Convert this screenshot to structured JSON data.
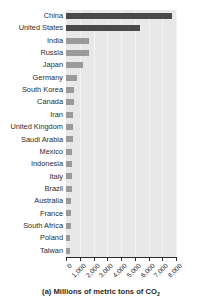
{
  "chart_data": {
    "type": "bar",
    "orientation": "horizontal",
    "title": "",
    "caption": "(a) Millions of metric tons of CO",
    "caption_subscript": "2",
    "xlabel": "Millions of metric tons of CO2",
    "ylabel": "",
    "xlim": [
      0,
      8000
    ],
    "ylim": null,
    "grid": true,
    "grid_axis": "x",
    "legend": false,
    "categories": [
      "China",
      "United States",
      "India",
      "Russia",
      "Japan",
      "Germany",
      "South Korea",
      "Canada",
      "Iran",
      "United Kingdom",
      "Saudi Arabia",
      "Mexico",
      "Indonesia",
      "Italy",
      "Brazil",
      "Australia",
      "France",
      "South Africa",
      "Poland",
      "Taiwan"
    ],
    "values": [
      7700,
      5400,
      1700,
      1700,
      1250,
      800,
      600,
      560,
      540,
      510,
      480,
      460,
      440,
      420,
      400,
      390,
      370,
      350,
      320,
      280
    ],
    "xticks": [
      0,
      1000,
      2000,
      3000,
      4000,
      5000,
      6000,
      7000,
      8000
    ],
    "xticklabels": [
      "0",
      "1,000",
      "2,000",
      "3,000",
      "4,000",
      "5,000",
      "6,000",
      "7,000",
      "8,000"
    ],
    "highlighted": [
      "China",
      "United States"
    ],
    "colors": {
      "bar": "#9a9a9a",
      "bar_highlight": "#4a4a4a",
      "plot_background": "#e8e8e8",
      "gridline": "#f4f4f4",
      "axis": "#2b2b2b",
      "text": "#2b2b2b",
      "figure_background": "#ffffff"
    }
  }
}
